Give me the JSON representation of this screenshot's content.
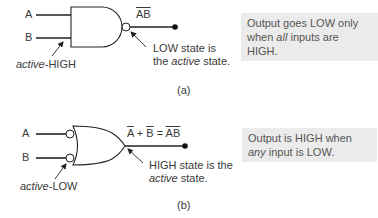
{
  "figure_a": {
    "input_a_label": "A",
    "input_b_label": "B",
    "output_label": "AB",
    "output_label_overline": true,
    "input_annotation": {
      "italic": "active",
      "rest": "-HIGH"
    },
    "output_annotation": {
      "line1": "LOW state is",
      "line2_prefix": "the ",
      "line2_italic": "active",
      "line2_suffix": " state."
    },
    "note": {
      "line1": "Output goes LOW only",
      "line2_prefix": "when ",
      "line2_italic": "all",
      "line2_suffix": " inputs are HIGH."
    },
    "caption": "(a)"
  },
  "figure_b": {
    "input_a_label": "A",
    "input_b_label": "B",
    "equation": {
      "term1": "A",
      "plus": " + ",
      "term2": "B",
      "equals": " = ",
      "result": "AB"
    },
    "input_annotation": {
      "italic": "active",
      "rest": "-LOW"
    },
    "output_annotation": {
      "line1": "HIGH state is the",
      "line2_italic": "active",
      "line2_suffix": " state."
    },
    "note": {
      "line1": "Output is HIGH when",
      "line2_italic": "any",
      "line2_suffix": " input is LOW."
    },
    "caption": "(b)"
  },
  "colors": {
    "line": "#222222",
    "note_bg": "#ebebeb",
    "text": "#3a3a3a"
  }
}
